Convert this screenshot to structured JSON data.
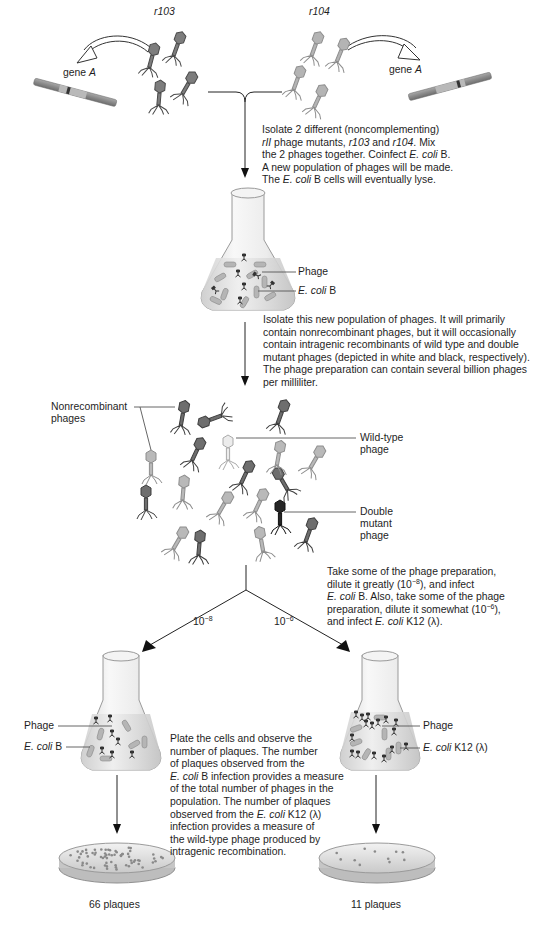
{
  "figure": {
    "top_labels": {
      "left_mutant": "r103",
      "right_mutant": "r104"
    },
    "gene_labels": {
      "left": "gene",
      "left_italic": "A",
      "right": "gene",
      "right_italic": "A"
    },
    "step1": {
      "lines": [
        [
          "Isolate 2 different (noncomplementing)"
        ],
        [
          "rII",
          " phage mutants, ",
          "r103",
          " and ",
          "r104",
          ". Mix"
        ],
        [
          "the 2 phages together. Coinfect ",
          "E. coli",
          " B."
        ],
        [
          "A new population of phages will be made."
        ],
        [
          "The ",
          "E. coli",
          " B cells will eventually lyse."
        ]
      ],
      "l0": "Isolate 2 different (noncomplementing)",
      "l1a": "rII",
      "l1b": " phage mutants, ",
      "l1c": "r103",
      "l1d": " and ",
      "l1e": "r104",
      "l1f": ". Mix",
      "l2a": "the 2 phages together. Coinfect ",
      "l2b": "E. coli",
      "l2c": " B.",
      "l3": "A new population of phages will be made.",
      "l4a": "The ",
      "l4b": "E. coli",
      "l4c": " B cells will eventually lyse."
    },
    "flask1": {
      "phage_label": "Phage",
      "ecoli_italic": "E. coli",
      "ecoli_suffix": " B"
    },
    "step2": {
      "l0": "Isolate this new population of phages. It will primarily",
      "l1": "contain nonrecombinant phages, but it will occasionally",
      "l2": "contain intragenic recombinants of wild type and double",
      "l3": "mutant phages (depicted in white and black, respectively).",
      "l4": "The phage preparation can contain several billion phages",
      "l5": "per milliliter."
    },
    "population": {
      "nonrecombinant_l0": "Nonrecombinant",
      "nonrecombinant_l1": "phages",
      "wildtype_l0": "Wild-type",
      "wildtype_l1": "phage",
      "double_l0": "Double",
      "double_l1": "mutant",
      "double_l2": "phage"
    },
    "step3": {
      "l0": "Take some of the phage preparation,",
      "l1a": "dilute it greatly (10",
      "l1sup": "−8",
      "l1b": "), and infect",
      "l2a": "E. coli",
      "l2b": " B. Also, take some of the phage",
      "l3a": "preparation, dilute it somewhat (10",
      "l3sup": "−6",
      "l3b": "),",
      "l4a": "and infect ",
      "l4b": "E. coli",
      "l4c": " K12 (λ)."
    },
    "dilutions": {
      "left_base": "10",
      "left_exp": "−8",
      "right_base": "10",
      "right_exp": "−6"
    },
    "flask_left": {
      "phage_label": "Phage",
      "ecoli_italic": "E. coli",
      "ecoli_suffix": " B"
    },
    "flask_right": {
      "phage_label": "Phage",
      "ecoli_italic": "E. coli",
      "ecoli_suffix": " K12 (λ)"
    },
    "step4": {
      "l0": "Plate the cells and observe the",
      "l1": "number of plaques. The number",
      "l2": "of plaques observed from the",
      "l3a": "E. coli",
      "l3b": " B infection provides a measure",
      "l4": "of the total number of phages in the",
      "l5": "population. The number of plaques",
      "l6a": "observed from the ",
      "l6b": "E. coli",
      "l6c": " K12 (λ)",
      "l7": "infection provides a measure of",
      "l8": "the wild-type phage produced by",
      "l9": "intragenic recombination."
    },
    "results": {
      "left_count": "66 plaques",
      "right_count": "11 plaques"
    },
    "colors": {
      "phage_mid": "#8a8a8a",
      "phage_light": "#bdbdbd",
      "phage_dark": "#4a4a4a",
      "phage_black": "#1e1e1e",
      "phage_white": "#ededed",
      "dna": "#8c8c8c",
      "arrow": "#111111",
      "leader_line": "#555555"
    }
  }
}
